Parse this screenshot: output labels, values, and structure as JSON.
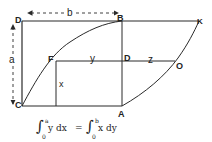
{
  "diagram": {
    "points": {
      "D_top": {
        "label": "D",
        "x": 22,
        "y": 21
      },
      "B": {
        "label": "B",
        "x": 122,
        "y": 21
      },
      "K": {
        "label": "K",
        "x": 199,
        "y": 21
      },
      "C": {
        "label": "C",
        "x": 22,
        "y": 106
      },
      "A": {
        "label": "A",
        "x": 122,
        "y": 106
      },
      "F": {
        "label": "F",
        "x": 56,
        "y": 61
      },
      "D_mid": {
        "label": "D",
        "x": 122,
        "y": 61
      },
      "O": {
        "label": "O",
        "x": 175,
        "y": 61
      }
    },
    "dimensions": {
      "width_label": "b",
      "height_label": "a"
    },
    "segments": {
      "y_label": "y",
      "z_label": "z",
      "x_label": "x"
    },
    "formula": {
      "lhs_lower": "0",
      "lhs_upper": "a",
      "lhs_integrand": "y dx",
      "equals": "=",
      "rhs_lower": "0",
      "rhs_upper": "b",
      "rhs_integrand": "x dy"
    },
    "colors": {
      "line": "#2a2a2a",
      "background": "#ffffff"
    }
  }
}
